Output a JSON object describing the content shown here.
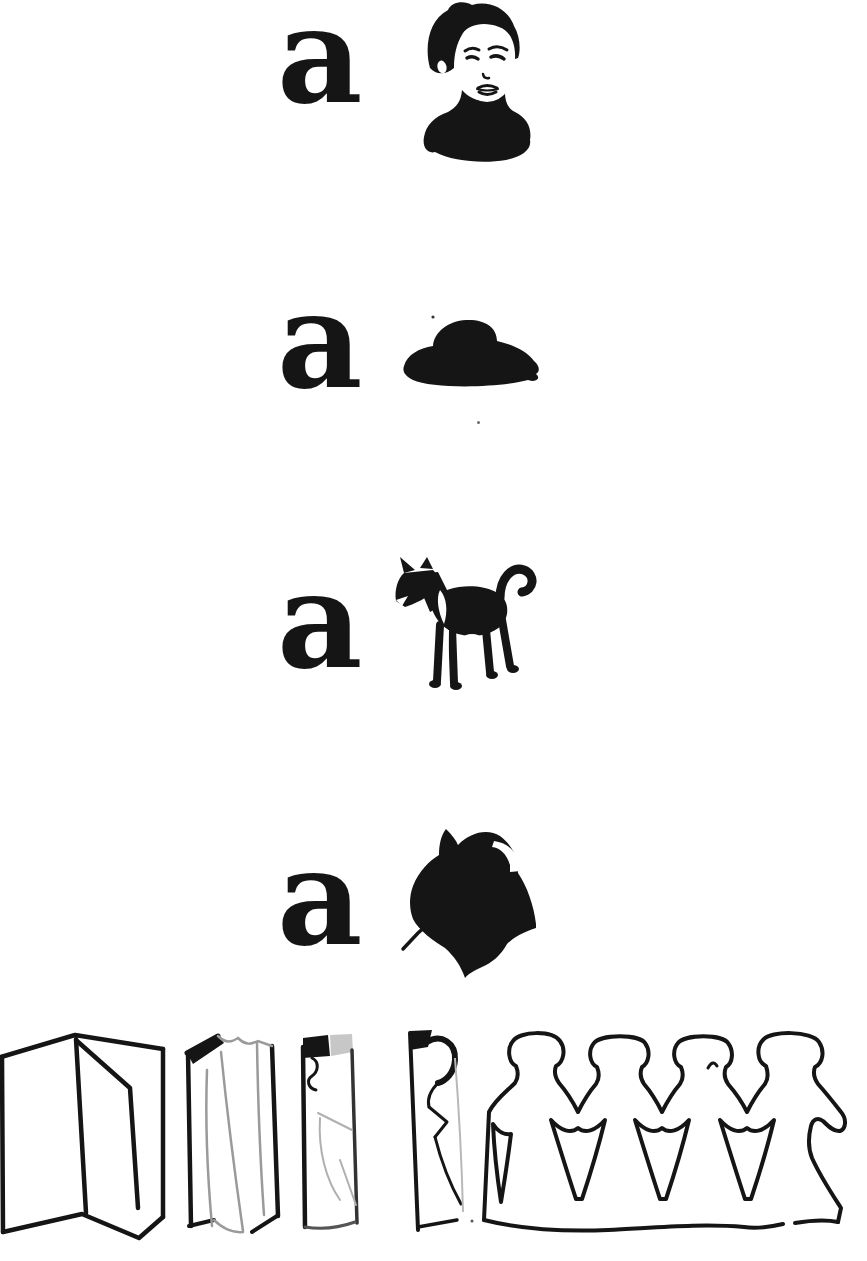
{
  "page": {
    "kind": "scanned primer page",
    "background_color": "#ffffff",
    "ink_color": "#151515",
    "sketch_gray": "#9a9a9a"
  },
  "rows": [
    {
      "letter": "a",
      "picture": "boy-head"
    },
    {
      "letter": "a",
      "picture": "flat-cap"
    },
    {
      "letter": "a",
      "picture": "dog"
    },
    {
      "letter": "a",
      "picture": "spinning-top"
    }
  ],
  "craft_steps": [
    {
      "name": "accordion-folded-paper-open"
    },
    {
      "name": "accordion-folded-paper-closed"
    },
    {
      "name": "folded-strip-blank"
    },
    {
      "name": "folded-strip-with-half-doll-outline"
    },
    {
      "name": "paper-doll-chain-unfolded",
      "dolls": 4
    }
  ]
}
